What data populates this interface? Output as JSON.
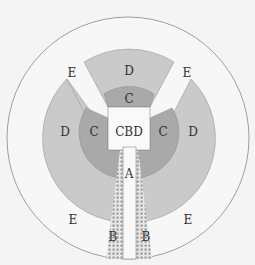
{
  "diagram": {
    "type": "urban-land-use-model",
    "zones": {
      "cbd": "CBD",
      "a": "A",
      "b": "B",
      "c": "C",
      "d": "D",
      "e": "E"
    },
    "labels": {
      "e_top_left": "E",
      "e_top_right": "E",
      "e_bottom_left": "E",
      "e_bottom_right": "E",
      "d_top": "D",
      "d_left": "D",
      "d_right": "D",
      "c_top": "C",
      "c_left": "C",
      "c_right": "C",
      "cbd": "CBD",
      "a": "A",
      "b_left": "B",
      "b_right": "B"
    },
    "colors": {
      "background": "#f4f4f4",
      "outer_ring": "#f6f6f6",
      "zone_d": "#c9c9c9",
      "zone_c": "#a8a8a8",
      "cbd": "#f8f8f8",
      "hatch": "#9a9a9a",
      "stroke": "#777777"
    }
  }
}
